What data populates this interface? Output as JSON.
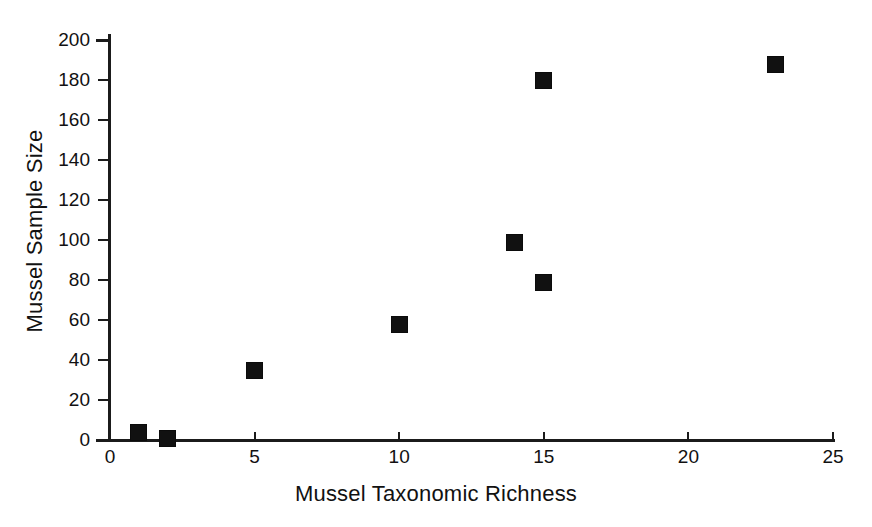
{
  "chart_data": {
    "type": "scatter",
    "title": "",
    "xlabel": "Mussel Taxonomic Richness",
    "ylabel": "Mussel Sample Size",
    "xlim": [
      0,
      25
    ],
    "ylim": [
      0,
      200
    ],
    "xticks": [
      0,
      5,
      10,
      15,
      20,
      25
    ],
    "yticks": [
      0,
      20,
      40,
      60,
      80,
      100,
      120,
      140,
      160,
      180,
      200
    ],
    "grid": false,
    "legend": null,
    "marker": "filled-square",
    "marker_color": "#111111",
    "background_color": "#ffffff",
    "points": [
      {
        "x": 1,
        "y": 4
      },
      {
        "x": 2,
        "y": 1
      },
      {
        "x": 5,
        "y": 35
      },
      {
        "x": 10,
        "y": 58
      },
      {
        "x": 14,
        "y": 99
      },
      {
        "x": 15,
        "y": 79
      },
      {
        "x": 15,
        "y": 180
      },
      {
        "x": 23,
        "y": 188
      }
    ]
  },
  "axes": {
    "x": {
      "label": "Mussel Taxonomic Richness",
      "tick_labels": [
        "0",
        "5",
        "10",
        "15",
        "20",
        "25"
      ]
    },
    "y": {
      "label": "Mussel Sample Size",
      "tick_labels": [
        "0",
        "20",
        "40",
        "60",
        "80",
        "100",
        "120",
        "140",
        "160",
        "180",
        "200"
      ]
    }
  }
}
